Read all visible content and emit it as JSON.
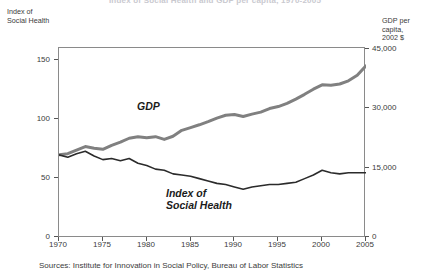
{
  "chart_title": "Index of Social Health and GDP per capita, 1970-2005",
  "left_axis": {
    "caption": "Index of\nSocial Health",
    "ticks": [
      "0",
      "50",
      "100",
      "150"
    ],
    "min": 0,
    "max": 160
  },
  "right_axis": {
    "caption": "GDP per capita,\n2002 $",
    "ticks": [
      "0",
      "15,000",
      "30,000",
      "45,000"
    ],
    "min": 0,
    "max": 48000
  },
  "x_axis": {
    "ticks": [
      "1970",
      "1975",
      "1980",
      "1985",
      "1990",
      "1995",
      "2000",
      "2005"
    ]
  },
  "series_labels": {
    "gdp": "GDP",
    "ish": "Index of\nSocial Health"
  },
  "sources": "Sources: Institute for Innovation in Social Policy, Bureau of Labor Statistics",
  "colors": {
    "gdp_line": "#808080",
    "ish_line": "#2b2b2b",
    "frame": "#8a8a8a",
    "text": "#3b3b3b"
  },
  "chart_data": {
    "type": "line",
    "title": "Index of Social Health and GDP per capita, 1970-2005",
    "xlabel": "",
    "ylabel": "Index of Social Health",
    "y2label": "GDP per capita, 2002 $",
    "xlim": [
      1970,
      2005
    ],
    "ylim": [
      0,
      160
    ],
    "y2lim": [
      0,
      48000
    ],
    "grid": false,
    "legend": "inline-annotations",
    "x": [
      1970,
      1971,
      1972,
      1973,
      1974,
      1975,
      1976,
      1977,
      1978,
      1979,
      1980,
      1981,
      1982,
      1983,
      1984,
      1985,
      1986,
      1987,
      1988,
      1989,
      1990,
      1991,
      1992,
      1993,
      1994,
      1995,
      1996,
      1997,
      1998,
      1999,
      2000,
      2001,
      2002,
      2003,
      2004,
      2005
    ],
    "series": [
      {
        "name": "Index of Social Health",
        "axis": "left",
        "color": "#2b2b2b",
        "values": [
          70,
          68,
          71,
          73,
          69,
          66,
          67,
          65,
          67,
          63,
          61,
          58,
          57,
          54,
          53,
          52,
          50,
          48,
          46,
          45,
          43,
          41,
          43,
          44,
          45,
          45,
          46,
          47,
          50,
          53,
          57,
          55,
          54,
          55,
          55,
          55
        ]
      },
      {
        "name": "GDP per capita",
        "axis": "right",
        "color": "#808080",
        "values": [
          21000,
          21300,
          22200,
          23100,
          22700,
          22400,
          23400,
          24200,
          25200,
          25600,
          25300,
          25600,
          24900,
          25700,
          27200,
          27900,
          28600,
          29400,
          30300,
          31000,
          31200,
          30700,
          31300,
          31800,
          32700,
          33200,
          34000,
          35100,
          36300,
          37600,
          38700,
          38600,
          38900,
          39700,
          41100,
          43500
        ]
      }
    ]
  }
}
